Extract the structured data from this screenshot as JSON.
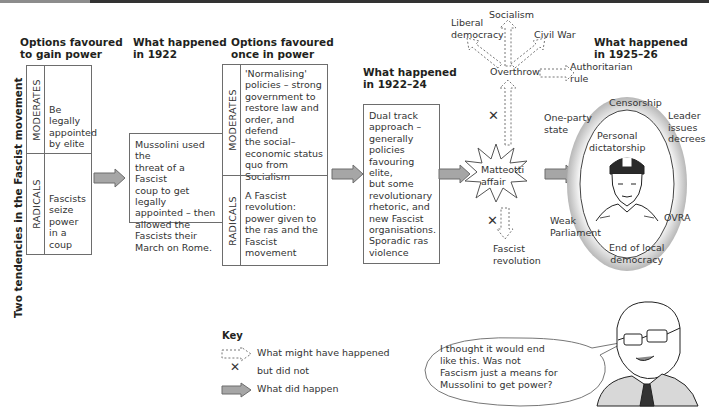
{
  "headers": {
    "col1": "Options favoured\nto gain power",
    "col2": "What happened\nin 1922",
    "col3": "Options favoured\nonce in power",
    "col4": "What happened\nin 1922–24",
    "col5": "What happened\nin 1925–26"
  },
  "side_title": "Two tendencies in the Fascist movement",
  "table1": {
    "moderates_label": "MODERATES",
    "moderates_text": "Be legally\nappointed\nby elite",
    "radicals_label": "RADICALS",
    "radicals_text": "Fascists\nseize\npower\nin a\ncoup"
  },
  "box1922": "Mussolini used the\nthreat of a Fascist\ncoup to get legally\nappointed – then\nallowed the\nFascists their\nMarch on Rome.",
  "table2": {
    "moderates_label": "MODERATES",
    "moderates_text": "'Normalising'\npolicies – strong\ngovernment to\nrestore law and\norder, and defend\nthe social–\neconomic status\nquo from\nSocialism",
    "radicals_label": "RADICALS",
    "radicals_text": "A Fascist\nrevolution:\npower given to\nthe ras and the\nFascist movement"
  },
  "box1922_24": "Dual track\napproach –\ngenerally\npolicies\nfavouring elite,\nbut some\nrevolutionary\nrhetoric, and\nnew Fascist\norganisations.\nSporadic ras\nviolence",
  "alternatives": {
    "event": "Matteotti\naffair",
    "overthrow": "Overthrow",
    "liberal_democracy": "Liberal\ndemocracy",
    "socialism": "Socialism",
    "civil_war": "Civil War",
    "authoritarian_rule": "Authoritarian\nrule",
    "fascist_revolution": "Fascist\nrevolution",
    "cross_mark": "✕"
  },
  "oval": {
    "center": "Personal\ndictatorship",
    "censorship": "Censorship",
    "one_party_state": "One-party\nstate",
    "leader_decrees": "Leader\nissues\ndecrees",
    "weak_parliament": "Weak\nParliament",
    "ovra": "OVRA",
    "end_local_democracy": "End of local\ndemocracy"
  },
  "key": {
    "title": "Key",
    "dashed": "What might have happened",
    "cross": "but did not",
    "cross_mark": "✕",
    "solid": "What did happen"
  },
  "speech_bubble": "I thought it would end\nlike this. Was not\nFascism just a means for\nMussolini to get power?",
  "colors": {
    "arrow_fill": "#a6a6a6",
    "arrow_stroke": "#6d6d6d",
    "border": "#6d6d6d",
    "oval_ring": "#cfcfcf"
  }
}
